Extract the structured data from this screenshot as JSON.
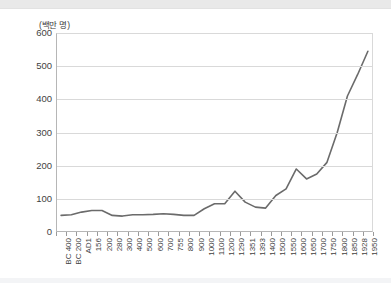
{
  "chart_data": {
    "type": "line",
    "title": "",
    "subtitle": "",
    "ylabel": "(백만 명)",
    "xlabel": "",
    "ylim": [
      0,
      600
    ],
    "yticks": [
      0,
      100,
      200,
      300,
      400,
      500,
      600
    ],
    "grid": true,
    "legend": false,
    "line_color": "#6b6b6b",
    "categories": [
      "BC 400",
      "BC 200",
      "AD1",
      "156",
      "200",
      "280",
      "300",
      "400",
      "500",
      "600",
      "700",
      "755",
      "800",
      "900",
      "1000",
      "1100",
      "1200",
      "1290",
      "1351",
      "1393",
      "1400",
      "1500",
      "1550",
      "1600",
      "1650",
      "1700",
      "1750",
      "1800",
      "1850",
      "1928",
      "1950"
    ],
    "series": [
      {
        "name": "인구",
        "values": [
          50,
          52,
          60,
          65,
          65,
          50,
          48,
          52,
          52,
          53,
          55,
          53,
          50,
          50,
          70,
          85,
          85,
          123,
          90,
          75,
          72,
          110,
          130,
          190,
          160,
          175,
          210,
          300,
          410,
          475,
          545
        ]
      }
    ]
  },
  "axis": {
    "y_unit_label": "(백만 명)"
  }
}
